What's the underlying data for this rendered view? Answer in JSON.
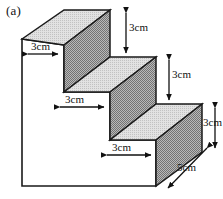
{
  "figure": {
    "label": "(a)",
    "type": "isometric-staircase-solid",
    "steps": 3,
    "background_color": "#ffffff",
    "outline_color": "#1a1a1a",
    "face_colors": {
      "front_left": "#ffffff",
      "top_tread": "#d8d8d8",
      "riser": "#9a9a9a",
      "right_end": "#9a9a9a"
    }
  },
  "dimensions": {
    "top_tread_width": "3cm",
    "top_riser_height": "3cm",
    "middle_tread_width": "3cm",
    "middle_riser_height": "3cm",
    "bottom_tread_width": "3cm",
    "bottom_riser_height": "3cm",
    "depth": "5cm"
  },
  "labels": {
    "tread_top": "3cm",
    "riser_top": "3cm",
    "tread_middle": "3cm",
    "riser_middle": "3cm",
    "tread_bottom": "3cm",
    "riser_bottom": "3cm",
    "depth": "5cm"
  }
}
